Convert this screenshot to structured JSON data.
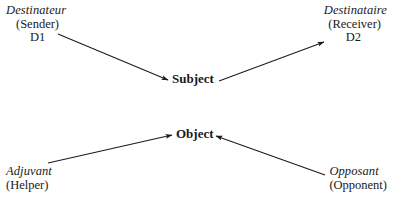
{
  "diagram": {
    "background_color": "#ffffff",
    "ink_color": "#1a1a1a",
    "nodes": {
      "sender": {
        "french": "Destinateur",
        "english": "(Sender)",
        "code": "D1"
      },
      "receiver": {
        "french": "Destinataire",
        "english": "(Receiver)",
        "code": "D2"
      },
      "helper": {
        "french": "Adjuvant",
        "english": "(Helper)"
      },
      "opponent": {
        "french": "Opposant",
        "english": "(Opponent)"
      },
      "subject": {
        "label": "Subject"
      },
      "object": {
        "label": "Object"
      }
    },
    "arrows": [
      {
        "name": "sender-to-subject",
        "from": "Destinateur (Sender) D1",
        "to": "Subject",
        "x1": 58,
        "y1": 34,
        "x2": 168,
        "y2": 80
      },
      {
        "name": "subject-to-receiver",
        "from": "Subject",
        "to": "Destinataire (Receiver) D2",
        "x1": 219,
        "y1": 81,
        "x2": 324,
        "y2": 42
      },
      {
        "name": "helper-to-object",
        "from": "Adjuvant (Helper)",
        "to": "Object",
        "x1": 48,
        "y1": 163,
        "x2": 172,
        "y2": 135
      },
      {
        "name": "opponent-to-object",
        "from": "Opposant (Opponent)",
        "to": "Object",
        "x1": 325,
        "y1": 175,
        "x2": 216,
        "y2": 136
      }
    ]
  }
}
